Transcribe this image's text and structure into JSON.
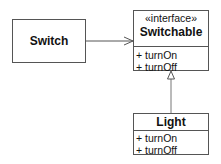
{
  "diagram": {
    "type": "uml-class",
    "classes": [
      {
        "name": "Switch",
        "stereotype": "",
        "operations": []
      },
      {
        "name": "Switchable",
        "stereotype": "«interface»",
        "operations": [
          "+ turnOn",
          "+ turnOff"
        ]
      },
      {
        "name": "Light",
        "stereotype": "",
        "operations": [
          "+ turnOn",
          "+ turnOff"
        ]
      }
    ],
    "relations": [
      {
        "from": "Switch",
        "to": "Switchable",
        "kind": "dependency-association"
      },
      {
        "from": "Light",
        "to": "Switchable",
        "kind": "realization"
      }
    ]
  }
}
